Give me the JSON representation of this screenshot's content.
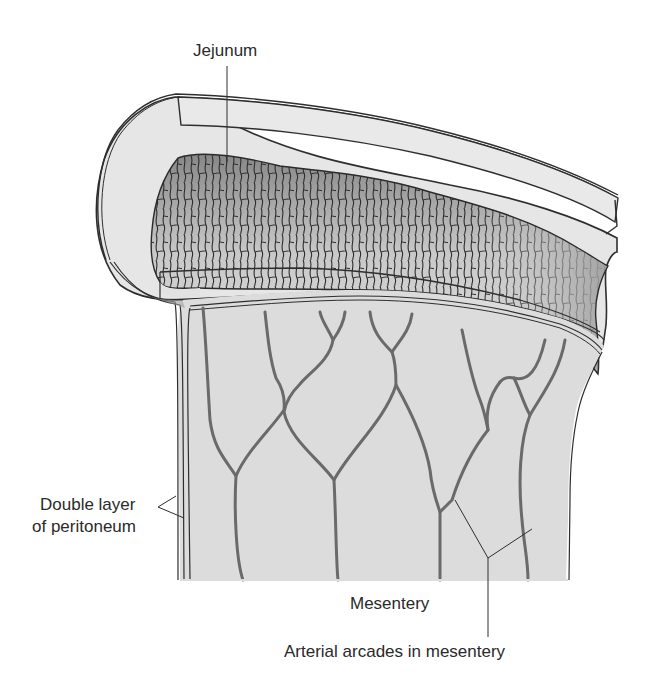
{
  "diagram": {
    "colors": {
      "background": "#ffffff",
      "wall_fill": "#e6e6e6",
      "mucosa_fill_dark": "#8a8a8a",
      "mucosa_fill_light": "#e0e0e0",
      "mesentery_fill": "#dcdcdc",
      "outline": "#2e2e2e",
      "vessel": "#6a6a6a",
      "label_text": "#2a2a2a"
    },
    "labels": {
      "jejunum": "Jejunum",
      "double_layer_line1": "Double layer",
      "double_layer_line2": "of peritoneum",
      "mesentery": "Mesentery",
      "arterial_arcades": "Arterial arcades in mesentery"
    }
  }
}
